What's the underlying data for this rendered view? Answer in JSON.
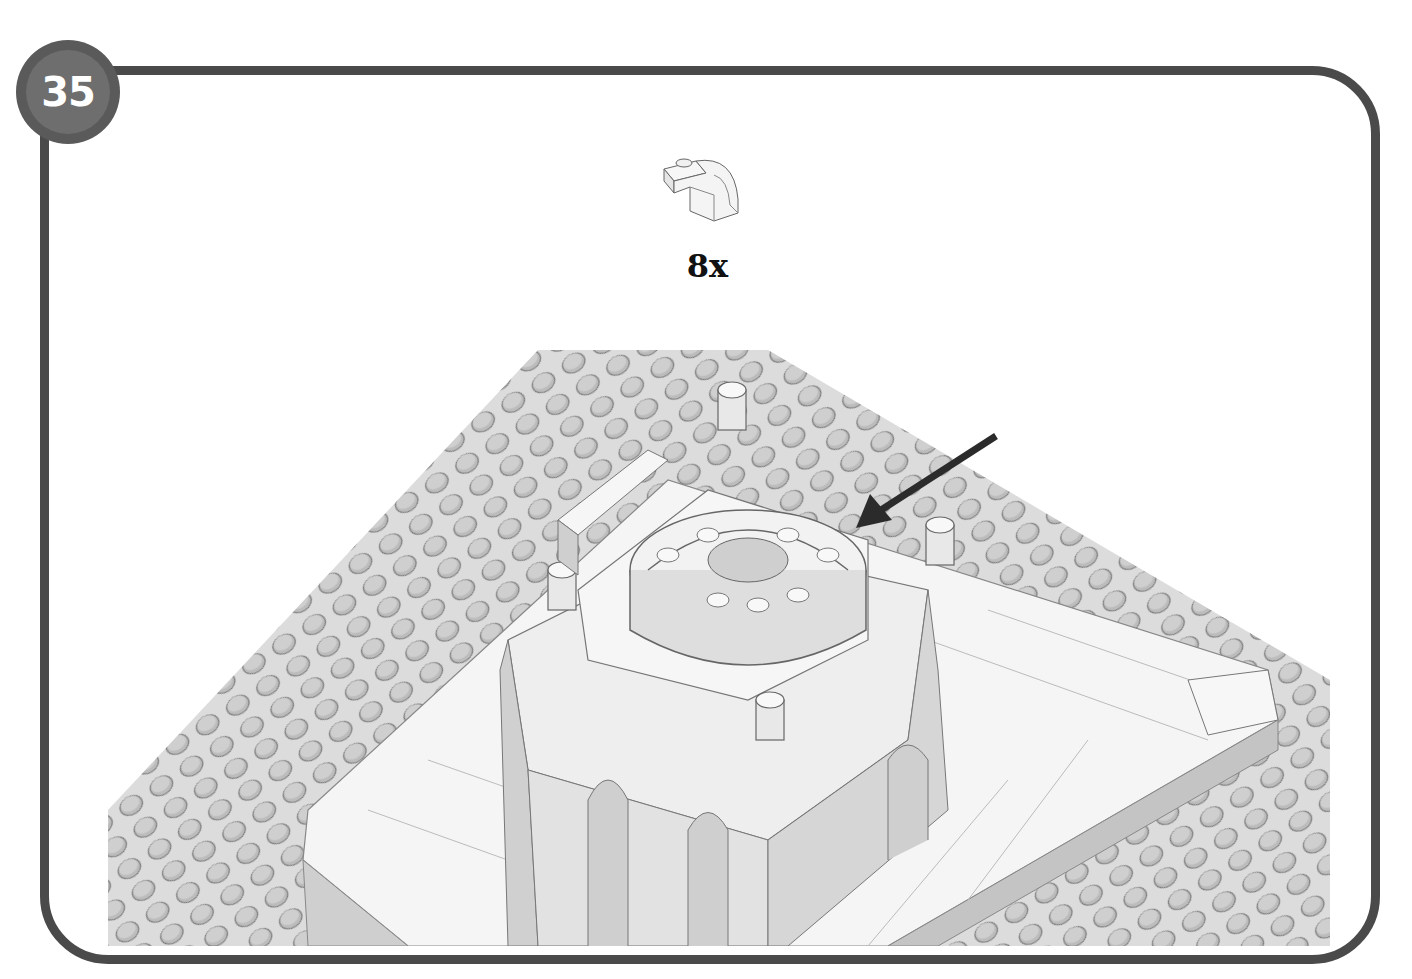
{
  "page": {
    "type": "building-instructions",
    "step_number": "35"
  },
  "parts_callout": {
    "parts": [
      {
        "name": "curved-slope-brick-with-stud",
        "color": "#ffffff",
        "quantity_label": "8x"
      }
    ]
  },
  "illustration": {
    "subject": "White domed palace model on gray baseplate",
    "baseplate_color": "#d9d9d9",
    "stud_color": "#bdbdbd",
    "brick_color": "#f4f4f4",
    "shadow_color": "#a8a8a8",
    "arrow": {
      "direction": "down-left",
      "color": "#2b2b2b",
      "points_to": "dome curved slope placement"
    }
  },
  "colors": {
    "frame": "#4a4a4a",
    "badge_outer": "#5a5a5a",
    "badge_inner": "#6e6e6e",
    "badge_text": "#ffffff",
    "qty_text": "#111111"
  }
}
